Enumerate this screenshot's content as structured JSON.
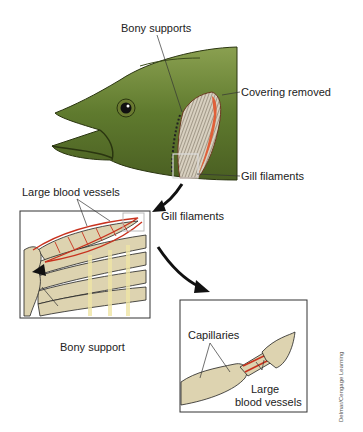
{
  "figure": {
    "panels": [
      {
        "name": "fish-head",
        "labels": [
          "Bony supports",
          "Covering removed",
          "Gill filaments"
        ]
      },
      {
        "name": "gill-arch-detail",
        "labels": [
          "Large blood vessels",
          "Gill filaments",
          "Bony support"
        ]
      },
      {
        "name": "filament-detail",
        "labels": [
          "Capillaries",
          "Large blood vessels"
        ]
      }
    ]
  },
  "labels": {
    "bony_supports": "Bony supports",
    "covering_removed": "Covering removed",
    "gill_filaments_top": "Gill filaments",
    "large_blood_vessels_top": "Large blood vessels",
    "gill_filaments_mid": "Gill filaments",
    "bony_support": "Bony support",
    "capillaries": "Capillaries",
    "large_blood_vessels_bottom_1": "Large",
    "large_blood_vessels_bottom_2": "blood vessels"
  },
  "credit": "Delmar/Cengage Learning",
  "colors": {
    "fish_green": "#5f7a2e",
    "fish_dark": "#3a4a1a",
    "gill_red": "#e0603a",
    "vessel_red": "#c8321e",
    "bone_beige": "#ddd3b0",
    "filament_yellow": "#efe5a5"
  }
}
